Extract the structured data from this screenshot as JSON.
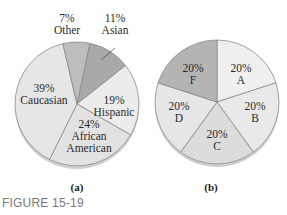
{
  "figure_caption": "FIGURE 15-19",
  "chart_data": [
    {
      "type": "pie",
      "caption": "(a)",
      "slices": [
        {
          "label": "Asian",
          "value": 11,
          "text": "11%",
          "color": "#a9a9a9"
        },
        {
          "label": "Hispanic",
          "value": 19,
          "text": "19%",
          "color": "#ececec"
        },
        {
          "label": "African American",
          "value": 24,
          "text": "24%",
          "color": "#e2e2e2"
        },
        {
          "label": "Caucasian",
          "value": 39,
          "text": "39%",
          "color": "#e6e6e6"
        },
        {
          "label": "Other",
          "value": 7,
          "text": "7%",
          "color": "#bdbdbd"
        }
      ]
    },
    {
      "type": "pie",
      "caption": "(b)",
      "slices": [
        {
          "label": "A",
          "value": 20,
          "text": "20%",
          "color": "#efefef"
        },
        {
          "label": "B",
          "value": 20,
          "text": "20%",
          "color": "#e9e9e9"
        },
        {
          "label": "C",
          "value": 20,
          "text": "20%",
          "color": "#dcdcdc"
        },
        {
          "label": "D",
          "value": 20,
          "text": "20%",
          "color": "#e6e6e6"
        },
        {
          "label": "F",
          "value": 20,
          "text": "20%",
          "color": "#b4b4b4"
        }
      ]
    }
  ]
}
